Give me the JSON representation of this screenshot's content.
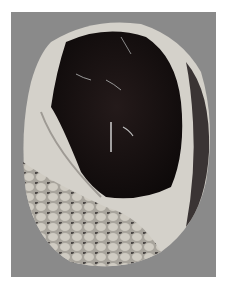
{
  "image": {
    "description": "Photograph of a sectioned gross pathology specimen on a gray background",
    "colors": {
      "page_background": "#ffffff",
      "photo_background": "#8a8a8a",
      "capsule_wall": "#d8d6d0",
      "hemorrhagic_core": "#1a1414",
      "fatty_tissue": "#b8b4ac"
    }
  }
}
